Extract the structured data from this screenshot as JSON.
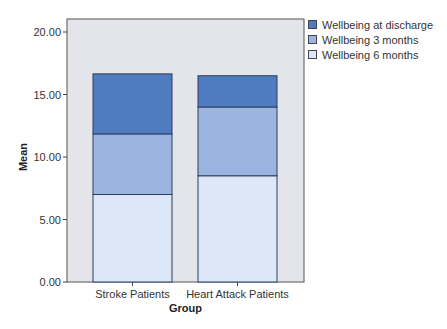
{
  "chart_data": {
    "type": "bar",
    "stacked": true,
    "title": "",
    "xlabel": "Group",
    "ylabel": "Mean",
    "ylim": [
      0,
      20
    ],
    "yticks": [
      "0.00",
      "5.00",
      "10.00",
      "15.00",
      "20.00"
    ],
    "categories": [
      "Stroke Patients",
      "Heart Attack Patients"
    ],
    "series": [
      {
        "name": "Wellbeing 6 months",
        "color": "#dce7f7",
        "values": [
          7.0,
          8.5
        ]
      },
      {
        "name": "Wellbeing 3 months",
        "color": "#9bb5e0",
        "values": [
          4.85,
          5.5
        ]
      },
      {
        "name": "Wellbeing at discharge",
        "color": "#4f7cc0",
        "values": [
          4.8,
          2.5
        ]
      }
    ],
    "legend": [
      "Wellbeing at discharge",
      "Wellbeing 3 months",
      "Wellbeing 6 months"
    ],
    "legend_position": "right",
    "grid": false,
    "plot_background": "#e4e5ea"
  },
  "legend": {
    "items": [
      {
        "label": "Wellbeing at discharge",
        "color": "#4f7cc0"
      },
      {
        "label": "Wellbeing 3 months",
        "color": "#9bb5e0"
      },
      {
        "label": "Wellbeing 6 months",
        "color": "#dce7f7"
      }
    ]
  }
}
